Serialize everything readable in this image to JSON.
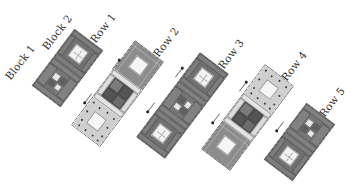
{
  "diagram": {
    "type": "quilt-assembly",
    "labels": {
      "block1": "Block 1",
      "block2": "Block 2",
      "row1": "Row 1",
      "row2": "Row 2",
      "row3": "Row 3",
      "row4": "Row 4",
      "row5": "Row 5"
    },
    "rows": [
      {
        "name": "Row 1",
        "blocks": [
          "dark-frame-light-center",
          "dark-four-patch"
        ]
      },
      {
        "name": "Row 2",
        "blocks": [
          "print-dark-light-center",
          "sashed-dark-four-patch",
          "print-light-dotted-center"
        ]
      },
      {
        "name": "Row 3",
        "blocks": [
          "dark-frame-light-center",
          "dark-four-patch",
          "dark-frame-light-center"
        ]
      },
      {
        "name": "Row 4",
        "blocks": [
          "print-light-dotted-center",
          "sashed-dark-four-patch",
          "print-dark-light-center"
        ]
      },
      {
        "name": "Row 5",
        "blocks": [
          "dark-four-patch",
          "dark-frame-light-center"
        ]
      }
    ],
    "pressing_arrows": [
      {
        "between": "Row 1 / Row 2",
        "directions": [
          "up-right",
          "down-left"
        ]
      },
      {
        "between": "Row 2 / Row 3",
        "directions": [
          "up-right",
          "down-left"
        ]
      },
      {
        "between": "Row 3 / Row 4",
        "directions": [
          "up-right",
          "down-left"
        ]
      },
      {
        "between": "Row 4 / Row 5",
        "directions": [
          "up-right",
          "down-left"
        ]
      }
    ],
    "colors": {
      "dark": "#707070",
      "light": "#f3f3f3",
      "sashing": "#e6e6e6",
      "print_light": "#cfcfcf",
      "print_dark": "#8c8c8c"
    }
  }
}
